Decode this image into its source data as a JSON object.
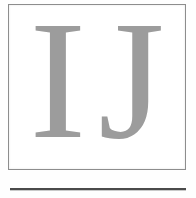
{
  "document": {
    "type": "scanned-page-fragment",
    "background_color": "#fefefe"
  },
  "letter_box": {
    "border_color": "#8d8d8d",
    "fill_color": "#ffffff",
    "initials": "IJ",
    "initials_color": "#9c9c9c",
    "letters": [
      {
        "glyph": "I",
        "name": "letter-i"
      },
      {
        "glyph": "J",
        "name": "letter-j"
      }
    ]
  },
  "divider": {
    "color": "#4a4a4a",
    "shadow_color": "#c9c9c9"
  }
}
